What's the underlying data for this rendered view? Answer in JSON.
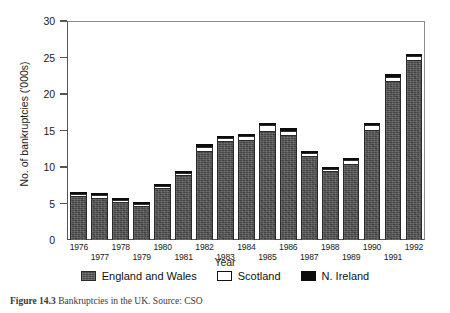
{
  "chart_data": {
    "type": "bar",
    "subtype": "stacked-vertical",
    "title": "",
    "xlabel": "Year",
    "ylabel": "No. of bankruptcies ('000s)",
    "ylim": [
      0,
      30
    ],
    "yticks": [
      0,
      5,
      10,
      15,
      20,
      25,
      30
    ],
    "grid": false,
    "legend_position": "bottom",
    "categories": [
      "1976",
      "1977",
      "1978",
      "1979",
      "1980",
      "1981",
      "1982",
      "1983",
      "1984",
      "1985",
      "1986",
      "1987",
      "1988",
      "1989",
      "1990",
      "1991",
      "1992"
    ],
    "series": [
      {
        "name": "England and Wales",
        "color": "#4a4a4a",
        "values": [
          6.0,
          5.8,
          5.2,
          4.6,
          7.1,
          8.9,
          12.2,
          13.6,
          13.7,
          15.0,
          14.4,
          11.5,
          9.4,
          10.4,
          15.1,
          21.8,
          24.6
        ]
      },
      {
        "name": "Scotland",
        "color": "#ffffff",
        "values": [
          0.15,
          0.25,
          0.25,
          0.25,
          0.15,
          0.15,
          0.6,
          0.4,
          0.5,
          0.7,
          0.6,
          0.4,
          0.35,
          0.5,
          0.6,
          0.6,
          0.6
        ]
      },
      {
        "name": "N. Ireland",
        "color": "#0c0c0c",
        "values": [
          0.05,
          0.05,
          0.05,
          0.05,
          0.05,
          0.05,
          0.1,
          0.1,
          0.1,
          0.1,
          0.1,
          0.1,
          0.05,
          0.1,
          0.1,
          0.1,
          0.1
        ]
      }
    ],
    "totals": [
      6.2,
      6.1,
      5.5,
      4.9,
      7.3,
      9.1,
      12.9,
      14.1,
      14.3,
      15.8,
      15.1,
      12.0,
      9.8,
      11.0,
      15.8,
      22.5,
      25.3
    ]
  },
  "axes": {
    "y_label": "No. of bankruptcies ('000s)",
    "x_label": "Year",
    "y_ticks": [
      "0",
      "5",
      "10",
      "15",
      "20",
      "25",
      "30"
    ]
  },
  "legend": {
    "items": [
      {
        "label": "England and Wales",
        "swatch": "england-wales-swatch"
      },
      {
        "label": "Scotland",
        "swatch": "scotland-swatch"
      },
      {
        "label": "N. Ireland",
        "swatch": "n-ireland-swatch"
      }
    ]
  },
  "caption": {
    "number": "Figure 14.3",
    "text": "Bankruptcies in the UK. Source: CSO"
  }
}
